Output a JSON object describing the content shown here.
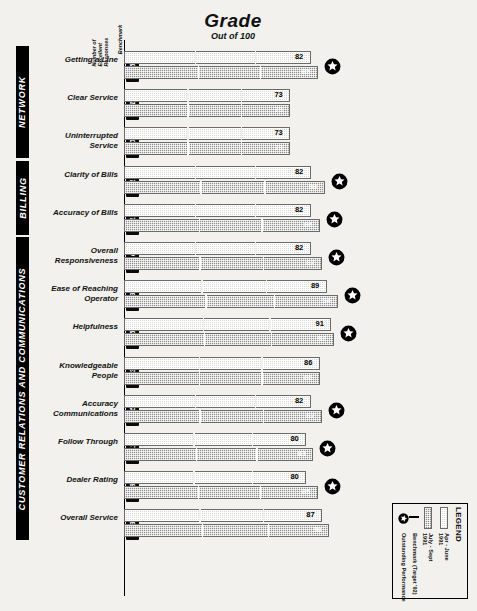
{
  "header": {
    "grade_title": "Grade",
    "grade_subtitle": "Out of 100",
    "col_responses": "Number of\nExcellent\nResponses",
    "col_benchmark": "Benchmark"
  },
  "groups": [
    {
      "label": "NETWORK"
    },
    {
      "label": "BILLING"
    },
    {
      "label": "CUSTOMER RELATIONS AND COMMUNICATIONS"
    }
  ],
  "legend": {
    "title": "LEGEND",
    "items": [
      {
        "icon": "swatch-q1",
        "label": "Apr - June\n1991"
      },
      {
        "icon": "swatch-q2",
        "label": "July - Sept\n1991"
      },
      {
        "icon": "benchmark-line",
        "label": "Benchmark (Target '92)"
      },
      {
        "icon": "star-icon",
        "label": "Outstanding Performance"
      }
    ]
  },
  "chart_data": {
    "type": "bar",
    "title": "Grade",
    "subtitle": "Out of 100",
    "xlabel": "",
    "ylabel": "",
    "xlim": [
      0,
      100
    ],
    "grid": false,
    "legend_position": "bottom-right",
    "series": [
      {
        "name": "Apr - June 1991",
        "key": "q1"
      },
      {
        "name": "July - Sept 1991",
        "key": "q2"
      }
    ],
    "categories": [
      "Getting a Line",
      "Clear Service",
      "Uninterrupted Service",
      "Clarity of Bills",
      "Accuracy of Bills",
      "Overall Responsiveness",
      "Ease of Reaching Operator",
      "Helpfulness",
      "Knowledgeable People",
      "Accuracy Communications",
      "Follow Through",
      "Dealer Rating",
      "Overall Service"
    ],
    "rows": [
      {
        "label": "Getting a Line",
        "group": 0,
        "delta": "+5",
        "n_top": "58",
        "n_bot": "53",
        "q1": 82,
        "q2": 85,
        "benchmark": 82,
        "star": true,
        "show_q1_value": true
      },
      {
        "label": "Clear Service",
        "group": 0,
        "delta": "+1",
        "n_top": "17",
        "n_bot": "20",
        "q1": 73,
        "q2": 73,
        "benchmark": 73,
        "star": false,
        "show_q1_value": true
      },
      {
        "label": "Uninterrupted Service",
        "group": 0,
        "delta": "+0",
        "n_top": "24",
        "n_bot": "35",
        "q1": 73,
        "q2": 73,
        "benchmark": 73,
        "star": false,
        "show_q1_value": true
      },
      {
        "label": "Clarity of Bills",
        "group": 1,
        "delta": "+17",
        "n_top": "24",
        "n_bot": "41",
        "q1": 82,
        "q2": 88,
        "benchmark": 82,
        "star": true,
        "show_q1_value": true
      },
      {
        "label": "Accuracy of Bills",
        "group": 1,
        "delta": "+12",
        "n_top": "31",
        "n_bot": "43",
        "q1": 82,
        "q2": 86,
        "benchmark": 82,
        "star": true,
        "show_q1_value": true
      },
      {
        "label": "Overall Responsiveness",
        "group": 2,
        "delta": "+10",
        "n_top": "36",
        "n_bot": "46",
        "q1": 82,
        "q2": 87,
        "benchmark": 82,
        "star": true,
        "show_q1_value": true
      },
      {
        "label": "Ease of Reaching Operator",
        "group": 2,
        "delta": "+9",
        "n_top": "45",
        "n_bot": "50",
        "q1": 89,
        "q2": 94,
        "benchmark": 89,
        "star": true,
        "show_q1_value": true
      },
      {
        "label": "Helpfulness",
        "group": 2,
        "delta": "+5",
        "n_top": "45",
        "n_bot": "55",
        "q1": 91,
        "q2": 92,
        "benchmark": 91,
        "star": true,
        "show_q1_value": true
      },
      {
        "label": "Knowledgeable People",
        "group": 2,
        "delta": "+3",
        "n_top": "31",
        "n_bot": "34",
        "q1": 86,
        "q2": 86,
        "benchmark": 86,
        "star": false,
        "show_q1_value": true
      },
      {
        "label": "Accuracy Communications",
        "group": 2,
        "delta": "+5",
        "n_top": "24",
        "n_bot": "35",
        "q1": 82,
        "q2": 87,
        "benchmark": 82,
        "star": true,
        "show_q1_value": true
      },
      {
        "label": "Follow Through",
        "group": 2,
        "delta": "+11",
        "n_top": "23",
        "n_bot": "34",
        "q1": 80,
        "q2": 83,
        "benchmark": 80,
        "star": true,
        "show_q1_value": true
      },
      {
        "label": "Dealer Rating",
        "group": 2,
        "delta": "+8",
        "n_top": "36",
        "n_bot": "36",
        "q1": 80,
        "q2": 85,
        "benchmark": 80,
        "star": true,
        "show_q1_value": true
      },
      {
        "label": "Overall Service",
        "group": 2,
        "delta": "+3",
        "n_top": "30",
        "n_bot": "35",
        "q1": 87,
        "q2": 90,
        "benchmark": 87,
        "star": false,
        "show_q1_value": true
      }
    ]
  }
}
